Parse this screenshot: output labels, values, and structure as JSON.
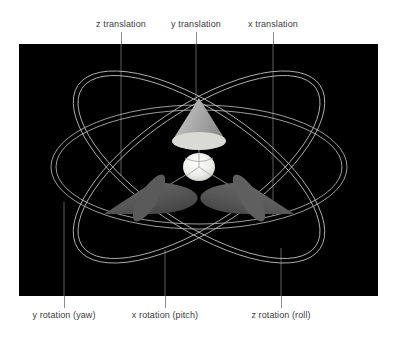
{
  "figure": {
    "canvas_color": "#000000",
    "page_background": "#ffffff",
    "label_color": "#3c3c3c",
    "leader_color": "#8c8c8c"
  },
  "top_labels": [
    {
      "id": "z-translation",
      "text": "z translation",
      "line_x": 121,
      "text_x": 121
    },
    {
      "id": "y-translation",
      "text": "y translation",
      "line_x": 196,
      "text_x": 196
    },
    {
      "id": "x-translation",
      "text": "x translation",
      "line_x": 273,
      "text_x": 273
    }
  ],
  "bottom_labels": [
    {
      "id": "y-rotation-yaw",
      "text": "y rotation (yaw)",
      "line_x": 64,
      "text_x": 64
    },
    {
      "id": "x-rotation-pitch",
      "text": "x rotation (pitch)",
      "line_x": 165,
      "text_x": 165
    },
    {
      "id": "z-rotation-roll",
      "text": "z rotation (roll)",
      "line_x": 281,
      "text_x": 281
    }
  ],
  "gizmo": {
    "center_sphere": {
      "color": "#e8e8e6",
      "radius": 16
    },
    "cones": [
      {
        "id": "y-axis-cone",
        "label": "y translation cone",
        "color": "#9c9c9c"
      },
      {
        "id": "z-axis-cone",
        "label": "z translation cone",
        "color": "#555555"
      },
      {
        "id": "x-axis-cone",
        "label": "x translation cone",
        "color": "#5e5e5e"
      }
    ],
    "rings": [
      {
        "id": "yaw-ring",
        "label": "y rotation ring (yaw)",
        "color": "#b4b4b4"
      },
      {
        "id": "pitch-ring",
        "label": "x rotation ring (pitch)",
        "color": "#b4b4b4"
      },
      {
        "id": "roll-ring",
        "label": "z rotation ring (roll)",
        "color": "#b4b4b4"
      }
    ]
  }
}
